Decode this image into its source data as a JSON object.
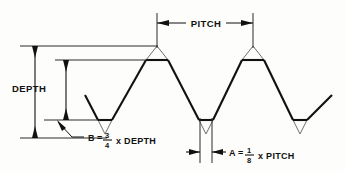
{
  "diagram": {
    "type": "technical-line-drawing",
    "background_color": "#fdfdfb",
    "line_color": "#111111",
    "ghost_line_color": "#6f6f6f",
    "labels": {
      "pitch": "PITCH",
      "depth": "DEPTH",
      "equation_b_variable": "B",
      "equation_b_equals": "=",
      "equation_b_numerator": "3",
      "equation_b_denominator": "4",
      "equation_b_multiplier": "x DEPTH",
      "equation_a_variable": "A",
      "equation_a_equals": "=",
      "equation_a_numerator": "1",
      "equation_a_denominator": "8",
      "equation_a_multiplier": "x PITCH"
    },
    "relations": {
      "b_full": "B = 3/4 x DEPTH",
      "a_full": "A = 1/8 x PITCH"
    },
    "geometry": {
      "crests_x": [
        157,
        253
      ],
      "roots_x": [
        105,
        206,
        300
      ],
      "theoretical_crest_y": 46,
      "flat_crest_y": 60,
      "flat_root_y": 120,
      "theoretical_root_y": 138,
      "pitch_span_x": [
        157,
        253
      ],
      "a_span_x": [
        200,
        212
      ],
      "depth_line_x": 35,
      "b_line_x": 66
    }
  }
}
